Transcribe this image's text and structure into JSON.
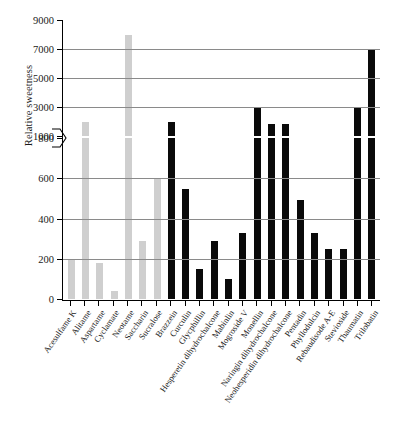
{
  "chart_data": {
    "type": "bar",
    "title": "",
    "xlabel": "",
    "ylabel": "Relative sweetness",
    "categories": [
      "Acesulfame K",
      "Alitame",
      "Aspartame",
      "Cyclamate",
      "Neotame",
      "Saccharin",
      "Sucralose",
      "Brazzein",
      "Curculin",
      "Glycphillin",
      "Hesperetin dihydrochalcone",
      "Mabinlin",
      "Mogroside V",
      "Monellin",
      "Naringin dihydrochalcone",
      "Neohesperidin dihydrochalcone",
      "Pentadin",
      "Phyllodulcin",
      "Rebaudisode A-E",
      "Stevioside",
      "Thaumatin",
      "Trilobatin"
    ],
    "values": [
      200,
      2000,
      180,
      40,
      8000,
      290,
      600,
      2000,
      545,
      150,
      290,
      100,
      330,
      3000,
      1800,
      1800,
      490,
      330,
      250,
      250,
      3000,
      7000
    ],
    "bar_groups": [
      "artificial",
      "artificial",
      "artificial",
      "artificial",
      "artificial",
      "artificial",
      "artificial",
      "natural",
      "natural",
      "natural",
      "natural",
      "natural",
      "natural",
      "natural",
      "natural",
      "natural",
      "natural",
      "natural",
      "natural",
      "natural",
      "natural",
      "natural"
    ],
    "colors": {
      "artificial": "#cfcfcf",
      "natural": "#0a0a0a",
      "gridline": "#8a8a8a",
      "axis": "#000000"
    },
    "broken_axis": true,
    "axis_break_between": [
      800,
      1000
    ],
    "lower_ticks": [
      0,
      200,
      400,
      600,
      800
    ],
    "upper_ticks": [
      1000,
      3000,
      5000,
      7000,
      9000
    ],
    "lower_range": [
      0,
      800
    ],
    "upper_range": [
      1000,
      9000
    ],
    "grid": true,
    "legend": "none"
  }
}
